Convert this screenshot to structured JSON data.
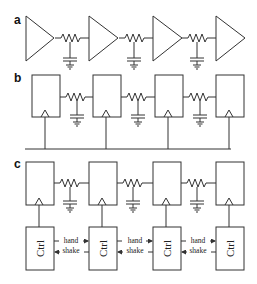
{
  "panels": [
    {
      "label": "a",
      "description": "Buffered repeater chain: triangle buffers connected by RC wire segments"
    },
    {
      "label": "b",
      "description": "Flip-flop pipeline with RC wire segments and shared clock bus"
    },
    {
      "label": "c",
      "description": "Flip-flop pipeline with local Ctrl blocks using hand shake signaling"
    }
  ],
  "ctrl_label": "Ctrl",
  "handshake": {
    "line1": "hand",
    "line2": "shake"
  },
  "colors": {
    "stroke": "#333333",
    "background": "#ffffff"
  }
}
